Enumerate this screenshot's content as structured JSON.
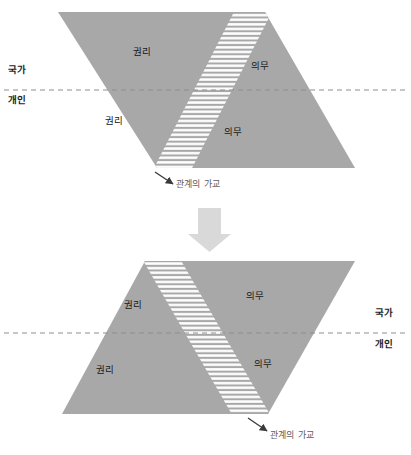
{
  "figure": {
    "title_visible": false,
    "colors": {
      "shape_fill": "#a8a8a8",
      "stripe": "#ffffff",
      "dashed_line": "#8d8d8d",
      "arrow_block": "#d9d9d9",
      "label_text": "#1d1d1d",
      "caption_text": "#5e5e5e",
      "background": "#ffffff"
    }
  },
  "diagram_top": {
    "name": "before-state",
    "axis_labels": {
      "upper": "국가",
      "lower": "개인"
    },
    "zones": {
      "rights_upper": "권리",
      "rights_lower": "권리",
      "duties_upper": "의무",
      "duties_lower": "의무"
    },
    "bridge_caption": "관계의 가교",
    "bridge_direction": "bottom-left-to-top-right",
    "axis_label_side": "left"
  },
  "transition": {
    "arrow": "down-arrow-icon",
    "direction": "down"
  },
  "diagram_bottom": {
    "name": "after-state",
    "axis_labels": {
      "upper": "국가",
      "lower": "개인"
    },
    "zones": {
      "rights_upper": "권리",
      "rights_lower": "권리",
      "duties_upper": "의무",
      "duties_lower": "의무"
    },
    "bridge_caption": "관계의 가교",
    "bridge_direction": "top-left-to-bottom-right",
    "axis_label_side": "right"
  }
}
